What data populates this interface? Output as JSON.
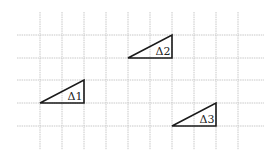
{
  "diagram": {
    "type": "grid-with-triangles",
    "grid": {
      "cell_size_px": 22.2,
      "vertical_lines_x": [
        40,
        62,
        84,
        106,
        128,
        150,
        172,
        194,
        216,
        238
      ],
      "vertical_span_y": [
        12,
        150
      ],
      "horizontal_lines_y": [
        35,
        58,
        80,
        103,
        126
      ],
      "horizontal_span_x": [
        17,
        264
      ],
      "line_color": "#c8c8c8"
    },
    "triangles": [
      {
        "label": "Δ1",
        "points": [
          [
            40,
            103
          ],
          [
            84,
            103
          ],
          [
            84,
            80
          ]
        ],
        "label_pos": [
          75,
          100
        ],
        "grid_size": "2 wide × 1 tall"
      },
      {
        "label": "Δ2",
        "points": [
          [
            128,
            58
          ],
          [
            172,
            58
          ],
          [
            172,
            35
          ]
        ],
        "label_pos": [
          163,
          55
        ],
        "grid_size": "2 wide × 1 tall"
      },
      {
        "label": "Δ3",
        "points": [
          [
            172,
            126
          ],
          [
            216,
            126
          ],
          [
            216,
            103
          ]
        ],
        "label_pos": [
          207,
          123
        ],
        "grid_size": "2 wide × 1 tall"
      }
    ],
    "stroke_color": "#1a1a1a"
  }
}
